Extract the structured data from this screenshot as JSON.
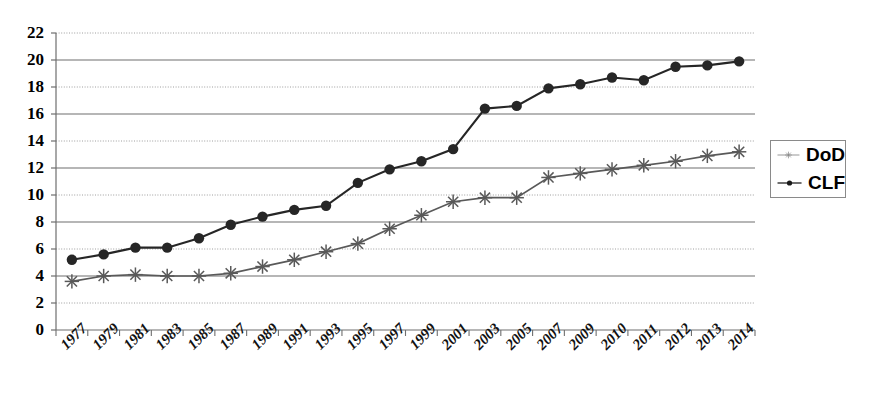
{
  "chart_data": {
    "type": "line",
    "title": "",
    "xlabel": "",
    "ylabel": "",
    "ylim": [
      0,
      22
    ],
    "ytick_step": 2,
    "grid": true,
    "legend_position": "right",
    "categories": [
      "1977",
      "1979",
      "1981",
      "1983",
      "1985",
      "1987",
      "1989",
      "1991",
      "1993",
      "1995",
      "1997",
      "1999",
      "2001",
      "2003",
      "2005",
      "2007",
      "2009",
      "2010",
      "2011",
      "2012",
      "2013",
      "2014"
    ],
    "yticks": [
      "0",
      "2",
      "4",
      "6",
      "8",
      "10",
      "12",
      "14",
      "16",
      "18",
      "20",
      "22"
    ],
    "series": [
      {
        "name": "DoD",
        "marker": "star",
        "color": "#595959",
        "values": [
          3.6,
          4.0,
          4.1,
          4.0,
          4.0,
          4.2,
          4.7,
          5.2,
          5.8,
          6.4,
          7.5,
          8.5,
          9.5,
          9.8,
          9.8,
          11.3,
          11.6,
          11.9,
          12.2,
          12.5,
          12.9,
          13.2
        ]
      },
      {
        "name": "CLF",
        "marker": "circle",
        "color": "#262626",
        "values": [
          5.2,
          5.6,
          6.1,
          6.1,
          6.8,
          7.8,
          8.4,
          8.9,
          9.2,
          10.9,
          11.9,
          12.5,
          13.4,
          16.4,
          16.6,
          17.9,
          18.2,
          18.7,
          18.5,
          19.5,
          19.6,
          19.9
        ]
      }
    ]
  },
  "legend": {
    "items": [
      {
        "label": "DoD"
      },
      {
        "label": "CLF"
      }
    ]
  },
  "axis": {
    "y_axis_name": "y-axis",
    "x_axis_name": "x-axis"
  }
}
